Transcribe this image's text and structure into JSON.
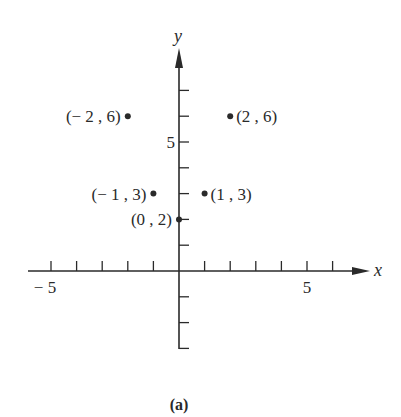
{
  "chart_data": {
    "type": "scatter",
    "title": "",
    "caption": "(a)",
    "xlabel": "x",
    "ylabel": "y",
    "xlim": [
      -5.5,
      7
    ],
    "ylim": [
      -3,
      8
    ],
    "grid": false,
    "x_ticks": [
      -5,
      -4,
      -3,
      -2,
      -1,
      1,
      2,
      3,
      4,
      5,
      6
    ],
    "y_ticks": [
      -3,
      -2,
      -1,
      1,
      2,
      3,
      4,
      5,
      6,
      7
    ],
    "x_tick_labels": [
      {
        "value": -5,
        "label": "− 5"
      },
      {
        "value": 5,
        "label": "5"
      }
    ],
    "y_tick_labels": [
      {
        "value": 5,
        "label": "5"
      }
    ],
    "points": [
      {
        "x": -2,
        "y": 6,
        "label": "(− 2 ,  6)",
        "label_side": "left"
      },
      {
        "x": 2,
        "y": 6,
        "label": "(2 ,  6)",
        "label_side": "right"
      },
      {
        "x": -1,
        "y": 3,
        "label": "(− 1 ,  3)",
        "label_side": "left"
      },
      {
        "x": 1,
        "y": 3,
        "label": "(1 ,  3)",
        "label_side": "right"
      },
      {
        "x": 0,
        "y": 2,
        "label": "(0 ,  2)",
        "label_side": "left"
      }
    ]
  },
  "colors": {
    "ink": "#2a2a2a",
    "background": "#ffffff"
  }
}
